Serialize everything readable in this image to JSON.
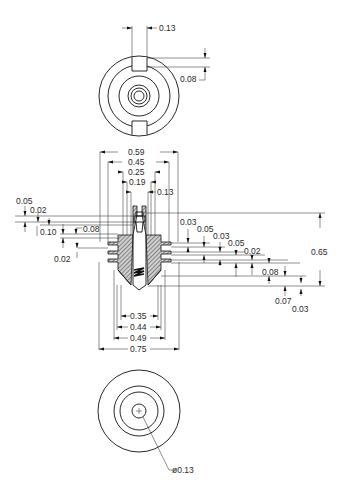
{
  "drawing": {
    "views": {
      "top_view": {
        "slot_width": "0.13",
        "slot_depth": "0.08"
      },
      "section_view": {
        "horizontal_dims_top": [
          "0.59",
          "0.45",
          "0.25",
          "0.19",
          "0.13"
        ],
        "horizontal_dims_bottom": [
          "0.35",
          "0.44",
          "0.49",
          "0.75"
        ],
        "left_vertical_dims": [
          "0.05",
          "0.02",
          "0.10",
          "0.08",
          "0.02"
        ],
        "right_vertical_dims": [
          "0.03",
          "0.05",
          "0.03",
          "0.05",
          "0.02",
          "0.08",
          "0.07",
          "0.03"
        ],
        "overall_height": "0.65"
      },
      "bottom_view": {
        "hole_diameter": "ø0.13"
      }
    }
  }
}
